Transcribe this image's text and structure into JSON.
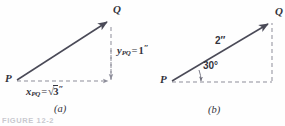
{
  "figure": {
    "footer_text": "FIGURE 12-2",
    "ink_color": "#4a4a57",
    "dash_color": "#8d8d99",
    "text_color": "#33333c",
    "background": "#fefefe"
  },
  "panel_a": {
    "caption": "(a)",
    "start_point_label": "P",
    "end_point_label": "Q",
    "x_component": {
      "symbol": "x",
      "subscript": "PQ",
      "equals": "=",
      "value": "3",
      "radical": "√",
      "unit": "″",
      "full_text": "x_PQ = √3″"
    },
    "y_component": {
      "symbol": "y",
      "subscript": "PQ",
      "equals": "=",
      "value": "1",
      "unit": "″",
      "full_text": "y_PQ = 1″"
    },
    "geometry": {
      "P": [
        16,
        81
      ],
      "Q": [
        111,
        19
      ],
      "corner": [
        111,
        81
      ]
    }
  },
  "panel_b": {
    "caption": "(b)",
    "start_point_label": "P",
    "end_point_label": "Q",
    "magnitude_label": "2″",
    "angle_label": "30°",
    "angle_degrees": 30,
    "geometry": {
      "P": [
        171,
        82
      ],
      "Q": [
        272,
        21
      ],
      "corner": [
        272,
        82
      ]
    }
  }
}
